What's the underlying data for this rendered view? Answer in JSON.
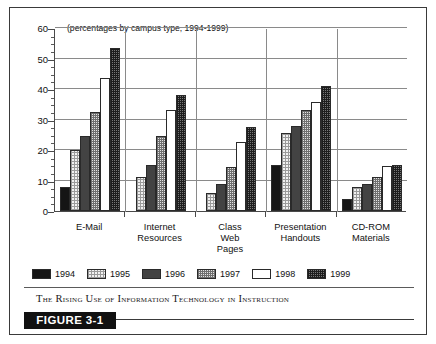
{
  "figure": {
    "badge_label": "FIGURE 3-1",
    "caption": "The Rising Use of Information Technology in Instruction"
  },
  "chart_data": {
    "type": "bar",
    "title": "The Rising Use of Information Technology in Instruction",
    "subtitle": "(percentages by campus type, 1994-1999)",
    "xlabel": "",
    "ylabel": "",
    "ylim": [
      0,
      60
    ],
    "ytick_labels": [
      "0",
      "10",
      "20",
      "30",
      "40",
      "50",
      "60"
    ],
    "ytick_values": [
      0,
      10,
      20,
      30,
      40,
      50,
      60
    ],
    "yminor_step": 2.5,
    "grid": true,
    "legend_position": "bottom-left",
    "categories": [
      "E-Mail",
      "Internet Resources",
      "Class Web Pages",
      "Presentation Handouts",
      "CD-ROM Materials"
    ],
    "category_label_lines": [
      [
        "E-Mail"
      ],
      [
        "Internet",
        "Resources"
      ],
      [
        "Class",
        "Web",
        "Pages"
      ],
      [
        "Presentation",
        "Handouts"
      ],
      [
        "CD-ROM",
        "Materials"
      ]
    ],
    "series": [
      {
        "name": "1994",
        "pattern": "solid-black",
        "values": [
          8,
          null,
          null,
          15,
          4
        ]
      },
      {
        "name": "1995",
        "pattern": "light-dotted",
        "values": [
          20,
          11,
          6,
          25.5,
          8
        ]
      },
      {
        "name": "1996",
        "pattern": "dark-gray",
        "values": [
          24.5,
          15,
          9,
          28,
          8.8
        ]
      },
      {
        "name": "1997",
        "pattern": "medium-dotted",
        "values": [
          32.5,
          24.5,
          14.5,
          33,
          11
        ]
      },
      {
        "name": "1998",
        "pattern": "white",
        "values": [
          43.5,
          33,
          22.5,
          35.8,
          14.8
        ]
      },
      {
        "name": "1999",
        "pattern": "dark-checkered",
        "values": [
          53.5,
          38,
          27.5,
          41,
          15.2
        ]
      }
    ]
  },
  "legend": {
    "items": [
      {
        "label": "1994"
      },
      {
        "label": "1995"
      },
      {
        "label": "1996"
      },
      {
        "label": "1997"
      },
      {
        "label": "1998"
      },
      {
        "label": "1999"
      }
    ]
  },
  "colors": {
    "frame": "#3a3a3a",
    "axis": "#4a4a4a",
    "grid": "#8a8a8a",
    "badge_bg": "#111111",
    "badge_text": "#ffffff"
  }
}
